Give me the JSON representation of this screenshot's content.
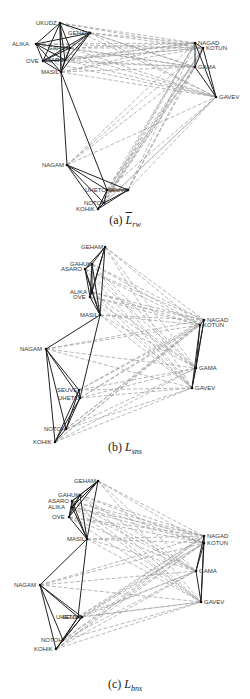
{
  "figure": {
    "panels": [
      {
        "id": "a",
        "caption_prefix": "(a) ",
        "caption_symbol": "L",
        "caption_sub": "rw",
        "caption_overline": true,
        "top": 0,
        "height": 230,
        "caption_top": 213,
        "nodes": [
          {
            "name": "UKUDZ",
            "x": 60,
            "y": 23,
            "lx": -24,
            "ly": 1
          },
          {
            "name": "GEHAM",
            "x": 90,
            "y": 33,
            "lx": -22,
            "ly": 1
          },
          {
            "name": "ALIKA",
            "x": 36,
            "y": 44,
            "lx": -24,
            "ly": 1
          },
          {
            "name": "GAHUK",
            "x": 70,
            "y": 48,
            "lx": -22,
            "ly": 1
          },
          {
            "name": "OVE",
            "x": 43,
            "y": 61,
            "lx": -17,
            "ly": 1
          },
          {
            "name": "ASARO",
            "x": 65,
            "y": 60,
            "lx": -22,
            "ly": 1
          },
          {
            "name": "MASIL",
            "x": 61,
            "y": 72,
            "lx": -20,
            "ly": 1
          },
          {
            "name": "NAGAD",
            "x": 195,
            "y": 43,
            "lx": 3,
            "ly": 1
          },
          {
            "name": "KOTUN",
            "x": 203,
            "y": 48,
            "lx": 3,
            "ly": 1
          },
          {
            "name": "GAMA",
            "x": 195,
            "y": 67,
            "lx": 3,
            "ly": 1
          },
          {
            "name": "GAVEV",
            "x": 216,
            "y": 97,
            "lx": 3,
            "ly": 1
          },
          {
            "name": "NAGAM",
            "x": 67,
            "y": 165,
            "lx": -25,
            "ly": 1
          },
          {
            "name": "UHETO",
            "x": 107,
            "y": 190,
            "lx": -22,
            "ly": 1
          },
          {
            "name": "SEUVE",
            "x": 128,
            "y": 190,
            "lx": -20,
            "ly": 1
          },
          {
            "name": "NOTOH",
            "x": 104,
            "y": 203,
            "lx": -20,
            "ly": 1
          },
          {
            "name": "KOHIK",
            "x": 98,
            "y": 209,
            "lx": -22,
            "ly": 1
          }
        ]
      },
      {
        "id": "b",
        "caption_prefix": "(b) ",
        "caption_symbol": "L",
        "caption_sub": "sns",
        "caption_overline": false,
        "top": 235,
        "height": 230,
        "caption_top": 205,
        "nodes": [
          {
            "name": "GEHAM",
            "x": 105,
            "y": 12,
            "lx": -24,
            "ly": 1
          },
          {
            "name": "GAHUK",
            "x": 92,
            "y": 29,
            "lx": -22,
            "ly": 1
          },
          {
            "name": "ASARO",
            "x": 85,
            "y": 34,
            "lx": -24,
            "ly": 1
          },
          {
            "name": "ALIKA",
            "x": 92,
            "y": 57,
            "lx": -22,
            "ly": 1
          },
          {
            "name": "OVE",
            "x": 90,
            "y": 62,
            "lx": -17,
            "ly": 1
          },
          {
            "name": "MASIL",
            "x": 100,
            "y": 80,
            "lx": -20,
            "ly": 1
          },
          {
            "name": "NAGAM",
            "x": 46,
            "y": 114,
            "lx": -26,
            "ly": 1
          },
          {
            "name": "SEUVE",
            "x": 79,
            "y": 155,
            "lx": -22,
            "ly": 1
          },
          {
            "name": "UHETO",
            "x": 80,
            "y": 163,
            "lx": -22,
            "ly": 1
          },
          {
            "name": "NOTOH",
            "x": 66,
            "y": 194,
            "lx": -22,
            "ly": 1
          },
          {
            "name": "KOHIK",
            "x": 55,
            "y": 207,
            "lx": -22,
            "ly": 1
          },
          {
            "name": "NAGAD",
            "x": 204,
            "y": 85,
            "lx": 3,
            "ly": 1
          },
          {
            "name": "KOTUN",
            "x": 200,
            "y": 90,
            "lx": 3,
            "ly": 1
          },
          {
            "name": "GAMA",
            "x": 196,
            "y": 133,
            "lx": 3,
            "ly": 1
          },
          {
            "name": "GAVEV",
            "x": 192,
            "y": 153,
            "lx": 3,
            "ly": 1
          }
        ]
      },
      {
        "id": "c",
        "caption_prefix": "(c) ",
        "caption_symbol": "L",
        "caption_sub": "bns",
        "caption_overline": false,
        "top": 465,
        "height": 234,
        "caption_top": 212,
        "nodes": [
          {
            "name": "GEHAM",
            "x": 98,
            "y": 16,
            "lx": -24,
            "ly": 1
          },
          {
            "name": "GAHUK",
            "x": 80,
            "y": 30,
            "lx": -22,
            "ly": 1
          },
          {
            "name": "ASARO",
            "x": 72,
            "y": 36,
            "lx": -24,
            "ly": 1
          },
          {
            "name": "ALIKA",
            "x": 72,
            "y": 42,
            "lx": -24,
            "ly": 1
          },
          {
            "name": "OVE",
            "x": 69,
            "y": 52,
            "lx": -17,
            "ly": 1
          },
          {
            "name": "MASIL",
            "x": 87,
            "y": 74,
            "lx": -20,
            "ly": 1
          },
          {
            "name": "NAGAM",
            "x": 40,
            "y": 120,
            "lx": -26,
            "ly": 1
          },
          {
            "name": "UHETO",
            "x": 78,
            "y": 152,
            "lx": -22,
            "ly": 1
          },
          {
            "name": "SEUVE",
            "x": 82,
            "y": 152,
            "lx": -20,
            "ly": 1
          },
          {
            "name": "NOTOH",
            "x": 63,
            "y": 175,
            "lx": -22,
            "ly": 1
          },
          {
            "name": "KOHIK",
            "x": 56,
            "y": 184,
            "lx": -22,
            "ly": 1
          },
          {
            "name": "NAGAD",
            "x": 204,
            "y": 71,
            "lx": 3,
            "ly": 1
          },
          {
            "name": "KOTUN",
            "x": 204,
            "y": 78,
            "lx": 3,
            "ly": 1
          },
          {
            "name": "GAMA",
            "x": 196,
            "y": 106,
            "lx": 3,
            "ly": 1
          },
          {
            "name": "GAVEV",
            "x": 201,
            "y": 137,
            "lx": 3,
            "ly": 1
          }
        ]
      }
    ],
    "colors": {
      "background": "#ffffff",
      "solid_edge": "#222222",
      "dashed_edge": "#999999",
      "node": "#111111",
      "label": "#333333"
    }
  }
}
